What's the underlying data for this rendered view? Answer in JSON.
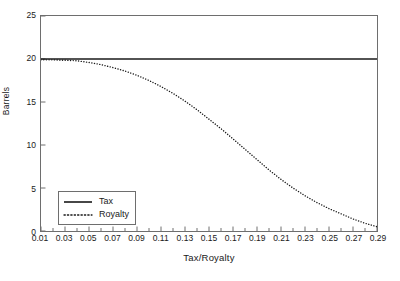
{
  "chart_data": {
    "type": "line",
    "title": "",
    "xlabel": "Tax/Royalty",
    "ylabel": "Barrels",
    "xlim": [
      0.01,
      0.29
    ],
    "ylim": [
      0,
      25
    ],
    "grid": false,
    "legend_position": "lower-left",
    "x_tick_labels": [
      "0.01",
      "0.03",
      "0.05",
      "0.07",
      "0.09",
      "0.11",
      "0.13",
      "0.15",
      "0.17",
      "0.19",
      "0.21",
      "0.23",
      "0.25",
      "0.27",
      "0.29"
    ],
    "x_tick_values": [
      0.01,
      0.03,
      0.05,
      0.07,
      0.09,
      0.11,
      0.13,
      0.15,
      0.17,
      0.19,
      0.21,
      0.23,
      0.25,
      0.27,
      0.29
    ],
    "x_minor_tick_values": [
      0.02,
      0.04,
      0.06,
      0.08,
      0.1,
      0.12,
      0.14,
      0.16,
      0.18,
      0.2,
      0.22,
      0.24,
      0.26,
      0.28
    ],
    "y_tick_labels": [
      "0",
      "5",
      "10",
      "15",
      "20",
      "25"
    ],
    "y_tick_values": [
      0,
      5,
      10,
      15,
      20,
      25
    ],
    "x": [
      0.01,
      0.02,
      0.03,
      0.04,
      0.05,
      0.06,
      0.07,
      0.08,
      0.09,
      0.1,
      0.11,
      0.12,
      0.13,
      0.14,
      0.15,
      0.16,
      0.17,
      0.18,
      0.19,
      0.2,
      0.21,
      0.22,
      0.23,
      0.24,
      0.25,
      0.26,
      0.27,
      0.28,
      0.29
    ],
    "series": [
      {
        "name": "Tax",
        "style": "solid",
        "color": "#1a1a1a",
        "values": [
          20,
          20,
          20,
          20,
          20,
          20,
          20,
          20,
          20,
          20,
          20,
          20,
          20,
          20,
          20,
          20,
          20,
          20,
          20,
          20,
          20,
          20,
          20,
          20,
          20,
          20,
          20,
          20,
          20
        ]
      },
      {
        "name": "Royalty",
        "style": "dotted",
        "color": "#1a1a1a",
        "values": [
          19.9,
          19.9,
          19.85,
          19.8,
          19.6,
          19.35,
          19.0,
          18.6,
          18.1,
          17.5,
          16.8,
          16.0,
          15.1,
          14.1,
          13.0,
          11.9,
          10.7,
          9.5,
          8.3,
          7.1,
          6.0,
          5.0,
          4.1,
          3.3,
          2.6,
          2.0,
          1.4,
          0.9,
          0.5
        ]
      }
    ]
  },
  "legend": {
    "items": [
      {
        "label": "Tax"
      },
      {
        "label": "Royalty"
      }
    ]
  }
}
